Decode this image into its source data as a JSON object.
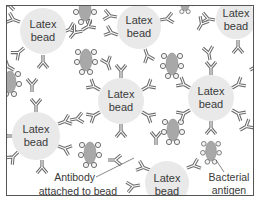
{
  "diagram": {
    "type": "latex agglutination illustration",
    "frame": {
      "x": 6,
      "y": 5,
      "width": 248,
      "height": 191,
      "stroke": "#555555"
    },
    "colors": {
      "bead_fill": "#e9e9e9",
      "antibody": "#6b6b6b",
      "antigen_fill": "#a8a8a8",
      "antigen_dot": "#8f8f8f",
      "text": "#3a3a3a"
    },
    "beads": [
      {
        "id": "bead-1",
        "cx": 43,
        "cy": 31,
        "r": 23,
        "line1": "Latex",
        "line2": "bead"
      },
      {
        "id": "bead-2",
        "cx": 139,
        "cy": 27,
        "r": 22,
        "line1": "Latex",
        "line2": "bead"
      },
      {
        "id": "bead-3",
        "cx": 236,
        "cy": 19,
        "r": 20,
        "line1": "Latex",
        "line2": "bead"
      },
      {
        "id": "bead-4",
        "cx": 121,
        "cy": 101,
        "r": 23,
        "line1": "Latex",
        "line2": "bead"
      },
      {
        "id": "bead-5",
        "cx": 211,
        "cy": 98,
        "r": 23,
        "line1": "Latex",
        "line2": "bead"
      },
      {
        "id": "bead-6",
        "cx": 36,
        "cy": 136,
        "r": 24,
        "line1": "Latex",
        "line2": "bead"
      },
      {
        "id": "bead-7",
        "cx": 167,
        "cy": 183,
        "r": 22,
        "line1": "Latex",
        "line2": "bead"
      }
    ],
    "callouts": {
      "antibody": {
        "line1": "Antibody",
        "line2": "attached to bead"
      },
      "antigen": {
        "line1": "Bacterial",
        "line2": "antigen"
      }
    }
  }
}
